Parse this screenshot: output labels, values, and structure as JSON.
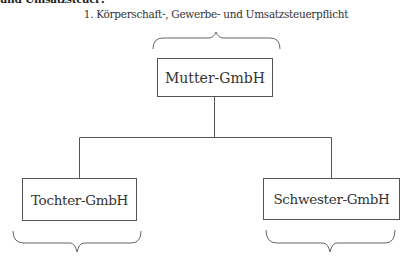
{
  "diagram": {
    "cutoff_text": "und Umsatzsteuer:",
    "heading": "1. Körperschaft-, Gewerbe- und Umsatzsteuerpflicht",
    "nodes": {
      "parent": "Mutter-GmbH",
      "child": "Tochter-GmbH",
      "sibling": "Schwester-GmbH"
    },
    "edges": [
      {
        "from": "parent",
        "to": "child"
      },
      {
        "from": "parent",
        "to": "sibling"
      }
    ],
    "braces": [
      {
        "target": "parent",
        "side": "top",
        "label_ref": "heading"
      },
      {
        "target": "child",
        "side": "bottom",
        "label": ""
      },
      {
        "target": "sibling",
        "side": "bottom",
        "label": ""
      }
    ]
  }
}
